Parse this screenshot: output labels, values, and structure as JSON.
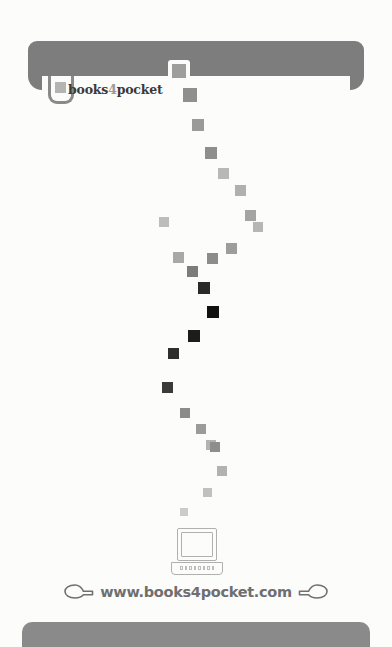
{
  "page": {
    "background_color": "#fcfcfb",
    "width": 392,
    "height": 647
  },
  "header": {
    "bar_color": "#7d7d7d",
    "notch_color": "#fcfcfb"
  },
  "logo": {
    "text_before": "books",
    "text_accent": "4",
    "text_after": "pocket",
    "full_text": "books4pocket",
    "text_color": "#3a3a3a",
    "accent_color": "#9a9a9a",
    "tab_border_color": "#8a8a8a",
    "tab_square_color": "#b4b4b4"
  },
  "trail": {
    "description": "diagonal trail of small squares from header notch down to computer icon, fading dark in the middle",
    "squares": [
      {
        "x": 172,
        "y": 64,
        "size": 14,
        "color": "#9e9e9e"
      },
      {
        "x": 183,
        "y": 88,
        "size": 14,
        "color": "#8f8f8f"
      },
      {
        "x": 192,
        "y": 119,
        "size": 12,
        "color": "#9a9a9a"
      },
      {
        "x": 205,
        "y": 147,
        "size": 12,
        "color": "#8e8e8e"
      },
      {
        "x": 218,
        "y": 168,
        "size": 11,
        "color": "#b8b8b8"
      },
      {
        "x": 235,
        "y": 185,
        "size": 11,
        "color": "#b0b0b0"
      },
      {
        "x": 245,
        "y": 210,
        "size": 11,
        "color": "#a4a4a4"
      },
      {
        "x": 253,
        "y": 222,
        "size": 10,
        "color": "#b6b6b6"
      },
      {
        "x": 159,
        "y": 217,
        "size": 10,
        "color": "#bdbdbd"
      },
      {
        "x": 226,
        "y": 243,
        "size": 11,
        "color": "#9d9d9d"
      },
      {
        "x": 173,
        "y": 252,
        "size": 11,
        "color": "#a8a8a8"
      },
      {
        "x": 207,
        "y": 253,
        "size": 11,
        "color": "#8c8c8c"
      },
      {
        "x": 187,
        "y": 266,
        "size": 11,
        "color": "#7c7c7c"
      },
      {
        "x": 198,
        "y": 282,
        "size": 12,
        "color": "#2a2a2a"
      },
      {
        "x": 207,
        "y": 306,
        "size": 12,
        "color": "#111111"
      },
      {
        "x": 188,
        "y": 330,
        "size": 12,
        "color": "#1c1c1c"
      },
      {
        "x": 168,
        "y": 348,
        "size": 11,
        "color": "#2e2e2e"
      },
      {
        "x": 162,
        "y": 382,
        "size": 11,
        "color": "#3a3a3a"
      },
      {
        "x": 180,
        "y": 408,
        "size": 10,
        "color": "#8b8b8b"
      },
      {
        "x": 196,
        "y": 424,
        "size": 10,
        "color": "#9b9b9b"
      },
      {
        "x": 206,
        "y": 440,
        "size": 10,
        "color": "#b3b3b3"
      },
      {
        "x": 210,
        "y": 442,
        "size": 10,
        "color": "#8e8e8e"
      },
      {
        "x": 217,
        "y": 466,
        "size": 10,
        "color": "#b2b2b2"
      },
      {
        "x": 203,
        "y": 488,
        "size": 9,
        "color": "#c0c0c0"
      },
      {
        "x": 180,
        "y": 508,
        "size": 8,
        "color": "#cccccc"
      }
    ]
  },
  "computer_icon": {
    "name": "desktop-computer-icon",
    "stroke_color": "#b0b0b0"
  },
  "url": {
    "text": "www.books4pocket.com",
    "color": "#6f6f6f",
    "left_icon": "pointing-hand-right-icon",
    "right_icon": "pointing-hand-left-icon",
    "icon_color": "#6f6f6f"
  },
  "footer": {
    "bar_color": "#8a8a8a"
  }
}
